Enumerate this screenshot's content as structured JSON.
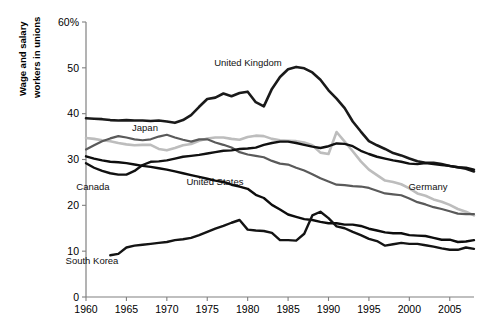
{
  "chart_data": {
    "type": "line",
    "title": "",
    "xlabel": "",
    "ylabel": "Wage and salary workers in unions",
    "xlim": [
      1960,
      2008
    ],
    "ylim": [
      0,
      60
    ],
    "grid": false,
    "legend_position": "inline-labels",
    "y_tick_labels": [
      "60%",
      "50",
      "40",
      "30",
      "20",
      "10",
      "0"
    ],
    "y_ticks": [
      60,
      50,
      40,
      30,
      20,
      10,
      0
    ],
    "x_tick_labels": [
      "1960",
      "1965",
      "1970",
      "1975",
      "1980",
      "1985",
      "1990",
      "1995",
      "2000",
      "2005"
    ],
    "x_ticks": [
      1960,
      1965,
      1970,
      1975,
      1980,
      1985,
      1990,
      1995,
      2000,
      2005
    ],
    "series": [
      {
        "name": "United Kingdom",
        "label": "United Kingdom",
        "color": "#1a1a1a",
        "width": 2.6,
        "label_x": 248,
        "label_y": 66,
        "x": [
          1960,
          1961,
          1962,
          1963,
          1964,
          1965,
          1966,
          1967,
          1968,
          1969,
          1970,
          1971,
          1972,
          1973,
          1974,
          1975,
          1976,
          1977,
          1978,
          1979,
          1980,
          1981,
          1982,
          1983,
          1984,
          1985,
          1986,
          1987,
          1988,
          1989,
          1990,
          1991,
          1992,
          1993,
          1994,
          1995,
          1996,
          1997,
          1998,
          1999,
          2000,
          2001,
          2002,
          2003,
          2004,
          2005,
          2006,
          2007,
          2008
        ],
        "y": [
          39.0,
          38.9,
          38.8,
          38.6,
          38.5,
          38.6,
          38.5,
          38.5,
          38.4,
          38.5,
          38.3,
          38.0,
          38.6,
          39.7,
          41.5,
          43.2,
          43.5,
          44.4,
          43.8,
          44.5,
          44.8,
          42.5,
          41.6,
          45.4,
          48.0,
          49.7,
          50.2,
          49.9,
          49.0,
          47.4,
          45.1,
          43.3,
          41.2,
          38.3,
          36.1,
          34.0,
          33.1,
          32.3,
          31.4,
          30.9,
          30.2,
          29.6,
          29.3,
          29.3,
          29.0,
          28.6,
          28.3,
          28.0,
          27.4
        ]
      },
      {
        "name": "Japan",
        "label": "Japan",
        "color": "#5a5a5a",
        "width": 2.2,
        "label_x": 145,
        "label_y": 131,
        "x": [
          1960,
          1961,
          1962,
          1963,
          1964,
          1965,
          1966,
          1967,
          1968,
          1969,
          1970,
          1971,
          1972,
          1973,
          1974,
          1975,
          1976,
          1977,
          1978,
          1979,
          1980,
          1981,
          1982,
          1983,
          1984,
          1985,
          1986,
          1987,
          1988,
          1989,
          1990,
          1991,
          1992,
          1993,
          1994,
          1995,
          1996,
          1997,
          1998,
          1999,
          2000,
          2001,
          2002,
          2003,
          2004,
          2005,
          2006,
          2007,
          2008
        ],
        "y": [
          32.2,
          33.1,
          34.0,
          34.6,
          35.1,
          34.8,
          34.4,
          34.2,
          34.4,
          35.0,
          35.4,
          34.8,
          34.3,
          33.9,
          34.4,
          34.4,
          33.7,
          33.2,
          32.6,
          31.6,
          31.1,
          30.8,
          30.5,
          29.7,
          29.1,
          28.9,
          28.2,
          27.6,
          26.8,
          25.9,
          25.2,
          24.5,
          24.4,
          24.2,
          24.1,
          23.8,
          23.2,
          22.6,
          22.4,
          22.2,
          21.5,
          20.7,
          20.2,
          19.6,
          19.2,
          18.7,
          18.2,
          18.1,
          18.1
        ]
      },
      {
        "name": "Canada",
        "label": "Canada",
        "color": "#111111",
        "width": 2.4,
        "label_x": 93,
        "label_y": 190,
        "x": [
          1960,
          1961,
          1962,
          1963,
          1964,
          1965,
          1966,
          1967,
          1968,
          1969,
          1970,
          1971,
          1972,
          1973,
          1974,
          1975,
          1976,
          1977,
          1978,
          1979,
          1980,
          1981,
          1982,
          1983,
          1984,
          1985,
          1986,
          1987,
          1988,
          1989,
          1990,
          1991,
          1992,
          1993,
          1994,
          1995,
          1996,
          1997,
          1998,
          1999,
          2000,
          2001,
          2002,
          2003,
          2004,
          2005,
          2006,
          2007,
          2008
        ],
        "y": [
          29.2,
          28.2,
          27.5,
          27.0,
          26.7,
          26.7,
          27.5,
          28.8,
          29.5,
          29.6,
          29.8,
          30.2,
          30.6,
          30.8,
          31.0,
          31.3,
          31.6,
          31.9,
          32.0,
          32.3,
          32.4,
          32.6,
          33.2,
          33.6,
          33.9,
          33.9,
          33.6,
          33.2,
          32.8,
          32.5,
          32.9,
          33.5,
          33.4,
          32.9,
          31.9,
          31.2,
          30.6,
          30.2,
          29.8,
          29.5,
          29.1,
          29.0,
          29.2,
          29.0,
          28.8,
          28.6,
          28.3,
          28.2,
          27.8
        ]
      },
      {
        "name": "United States",
        "label": "United States",
        "color": "#0d0d0d",
        "width": 2.4,
        "label_x": 215,
        "label_y": 185,
        "x": [
          1960,
          1961,
          1962,
          1963,
          1964,
          1965,
          1966,
          1967,
          1968,
          1969,
          1970,
          1971,
          1972,
          1973,
          1974,
          1975,
          1976,
          1977,
          1978,
          1979,
          1980,
          1981,
          1982,
          1983,
          1984,
          1985,
          1986,
          1987,
          1988,
          1989,
          1990,
          1991,
          1992,
          1993,
          1994,
          1995,
          1996,
          1997,
          1998,
          1999,
          2000,
          2001,
          2002,
          2003,
          2004,
          2005,
          2006,
          2007,
          2008
        ],
        "y": [
          30.7,
          30.2,
          29.8,
          29.5,
          29.4,
          29.2,
          28.9,
          28.6,
          28.4,
          28.1,
          27.8,
          27.4,
          27.0,
          26.6,
          26.2,
          25.8,
          25.4,
          25.1,
          24.5,
          24.1,
          23.6,
          22.3,
          21.6,
          20.1,
          19.1,
          18.0,
          17.5,
          17.0,
          16.8,
          16.4,
          16.1,
          16.1,
          15.8,
          15.8,
          15.5,
          14.9,
          14.5,
          14.1,
          13.9,
          13.9,
          13.5,
          13.4,
          13.3,
          12.9,
          12.5,
          12.5,
          12.0,
          12.1,
          12.4
        ]
      },
      {
        "name": "Germany",
        "label": "Germany",
        "color": "#bdbdbd",
        "width": 2.6,
        "label_x": 428,
        "label_y": 190,
        "x": [
          1960,
          1961,
          1962,
          1963,
          1964,
          1965,
          1966,
          1967,
          1968,
          1969,
          1970,
          1971,
          1972,
          1973,
          1974,
          1975,
          1976,
          1977,
          1978,
          1979,
          1980,
          1981,
          1982,
          1983,
          1984,
          1985,
          1986,
          1987,
          1988,
          1989,
          1990,
          1991,
          1992,
          1993,
          1994,
          1995,
          1996,
          1997,
          1998,
          1999,
          2000,
          2001,
          2002,
          2003,
          2004,
          2005,
          2006,
          2007,
          2008
        ],
        "y": [
          34.7,
          34.5,
          34.2,
          34.0,
          33.6,
          33.3,
          33.1,
          33.2,
          33.2,
          32.3,
          32.0,
          32.5,
          33.1,
          33.4,
          34.1,
          34.6,
          34.8,
          34.8,
          34.5,
          34.3,
          34.9,
          35.2,
          35.1,
          34.5,
          34.2,
          34.1,
          34.0,
          33.7,
          33.1,
          31.5,
          31.2,
          36.0,
          33.9,
          31.8,
          29.6,
          27.8,
          26.6,
          25.4,
          25.1,
          24.6,
          23.7,
          22.6,
          22.1,
          21.3,
          20.8,
          20.1,
          19.2,
          18.6,
          17.8
        ]
      },
      {
        "name": "South Korea",
        "label": "South Korea",
        "color": "#141414",
        "width": 2.4,
        "label_x": 92,
        "label_y": 264,
        "x": [
          1963,
          1964,
          1965,
          1966,
          1967,
          1968,
          1969,
          1970,
          1971,
          1972,
          1973,
          1974,
          1975,
          1976,
          1977,
          1978,
          1979,
          1980,
          1981,
          1982,
          1983,
          1984,
          1985,
          1986,
          1987,
          1988,
          1989,
          1990,
          1991,
          1992,
          1993,
          1994,
          1995,
          1996,
          1997,
          1998,
          1999,
          2000,
          2001,
          2002,
          2003,
          2004,
          2005,
          2006,
          2007,
          2008
        ],
        "y": [
          9.1,
          9.4,
          10.8,
          11.2,
          11.4,
          11.6,
          11.8,
          12.0,
          12.4,
          12.6,
          12.9,
          13.5,
          14.2,
          14.9,
          15.5,
          16.2,
          16.8,
          14.7,
          14.5,
          14.4,
          14.0,
          12.4,
          12.4,
          12.3,
          13.8,
          17.8,
          18.6,
          17.2,
          15.4,
          15.0,
          14.2,
          13.5,
          12.7,
          12.2,
          11.2,
          11.5,
          11.8,
          11.6,
          11.6,
          11.3,
          11.0,
          10.6,
          10.3,
          10.3,
          10.8,
          10.5
        ]
      }
    ]
  },
  "axis": {
    "y_label_line1": "Wage and salary",
    "y_label_line2": "workers in unions"
  }
}
